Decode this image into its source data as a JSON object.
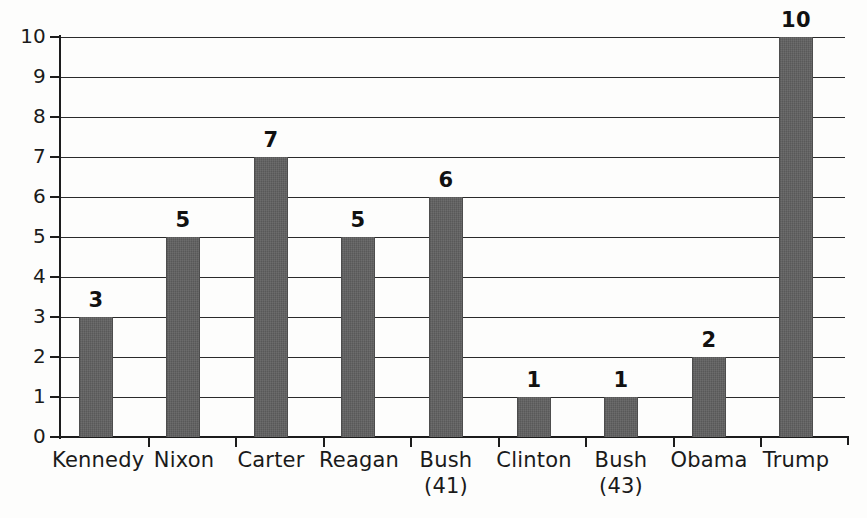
{
  "chart_data": {
    "type": "bar",
    "title": "",
    "xlabel": "",
    "ylabel": "",
    "ylim": [
      0,
      10
    ],
    "ytick_step": 1,
    "grid": true,
    "legend": false,
    "orientation": "vertical",
    "categories": [
      "Kennedy",
      "Nixon",
      "Carter",
      "Reagan",
      "Bush (41)",
      "Clinton",
      "Bush (43)",
      "Obama",
      "Trump"
    ],
    "category_lines": [
      {
        "line1": "Kennedy",
        "line2": ""
      },
      {
        "line1": "Nixon",
        "line2": ""
      },
      {
        "line1": "Carter",
        "line2": ""
      },
      {
        "line1": "Reagan",
        "line2": ""
      },
      {
        "line1": "Bush",
        "line2": "(41)"
      },
      {
        "line1": "Clinton",
        "line2": ""
      },
      {
        "line1": "Bush",
        "line2": "(43)"
      },
      {
        "line1": "Obama",
        "line2": ""
      },
      {
        "line1": "Trump",
        "line2": ""
      }
    ],
    "values": [
      3,
      5,
      7,
      5,
      6,
      1,
      1,
      2,
      10
    ],
    "value_labels": [
      "3",
      "5",
      "7",
      "5",
      "6",
      "1",
      "1",
      "2",
      "10"
    ],
    "ytick_labels": [
      "0",
      "1",
      "2",
      "3",
      "4",
      "5",
      "6",
      "7",
      "8",
      "9",
      "10"
    ],
    "bar_color": "#5e5e5e",
    "axis_color": "#1c1c1c",
    "grid_color": "#2a2a2a",
    "background_color": "#fdfdfc",
    "text_color": "#1a1a1a"
  }
}
